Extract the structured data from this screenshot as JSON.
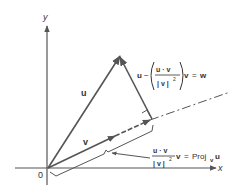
{
  "diagram": {
    "colors": {
      "background": "#ffffff",
      "stroke": "#555555",
      "text": "#333333"
    },
    "axes": {
      "x_label": "x",
      "y_label": "y",
      "origin_label": "0"
    },
    "vectors": {
      "u_label": "u",
      "v_label": "v"
    },
    "w_formula": {
      "lead": "u",
      "minus": "−",
      "numerator": "u · v",
      "denominator": "| v |",
      "exponent": "2",
      "trail_v": "v",
      "equals": "=",
      "result": "w"
    },
    "proj_formula": {
      "numerator": "u · v",
      "denominator": "| v |",
      "exponent": "2",
      "trail_v": "v",
      "equals": "=",
      "proj": "Proj",
      "proj_sub": "v",
      "proj_arg": "u"
    }
  }
}
